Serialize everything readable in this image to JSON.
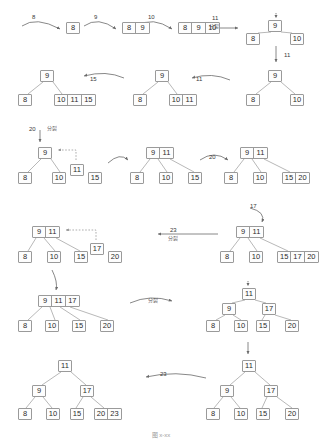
{
  "figure": {
    "caption": "图 x-xx",
    "colors": {
      "box_border": "#9a9a9a",
      "box_fill": "#fdfdfd",
      "text": "#2b2b2b",
      "arrow": "#6a6a6a",
      "dashed_arrow": "#8a8a8a"
    }
  },
  "labels": {
    "split": "分裂",
    "insert_8": "8",
    "insert_9": "9",
    "insert_10": "10",
    "insert_11": "11",
    "insert_15": "15",
    "insert_17": "17",
    "insert_20": "20",
    "insert_23": "23"
  },
  "chart_data": {
    "type": "diagram",
    "steps": [
      {
        "id": "s1",
        "row": 1,
        "keys_inserted": "8",
        "nodes": [
          {
            "keys": [
              "8"
            ],
            "level": 0
          }
        ]
      },
      {
        "id": "s2",
        "row": 1,
        "keys_inserted": "9",
        "nodes": [
          {
            "keys": [
              "8",
              "9"
            ],
            "level": 0
          }
        ]
      },
      {
        "id": "s3",
        "row": 1,
        "keys_inserted": "10",
        "nodes": [
          {
            "keys": [
              "8",
              "9",
              "10"
            ],
            "level": 0
          }
        ]
      },
      {
        "id": "s4",
        "row": 1,
        "keys_inserted": "11",
        "action": "分裂",
        "nodes": [
          {
            "keys": [
              "9"
            ],
            "level": 0
          },
          {
            "keys": [
              "8"
            ],
            "level": 1
          },
          {
            "keys": [
              "10"
            ],
            "level": 1
          }
        ]
      },
      {
        "id": "s5",
        "row": 2,
        "keys_inserted": "11",
        "nodes": [
          {
            "keys": [
              "9"
            ],
            "level": 0
          },
          {
            "keys": [
              "8"
            ],
            "level": 1
          },
          {
            "keys": [
              "10"
            ],
            "level": 1
          }
        ]
      },
      {
        "id": "s6",
        "row": 2,
        "keys_inserted": "11",
        "nodes": [
          {
            "keys": [
              "9"
            ],
            "level": 0
          },
          {
            "keys": [
              "8"
            ],
            "level": 1
          },
          {
            "keys": [
              "10",
              "11"
            ],
            "level": 1
          }
        ]
      },
      {
        "id": "s7",
        "row": 2,
        "keys_inserted": "15",
        "nodes": [
          {
            "keys": [
              "9"
            ],
            "level": 0
          },
          {
            "keys": [
              "8"
            ],
            "level": 1
          },
          {
            "keys": [
              "10",
              "11",
              "15"
            ],
            "level": 1
          }
        ]
      },
      {
        "id": "s8",
        "row": 3,
        "keys_inserted": "20",
        "action": "分裂",
        "nodes": [
          {
            "keys": [
              "9"
            ],
            "level": 0
          },
          {
            "keys": [
              "8"
            ],
            "level": 1
          },
          {
            "keys": [
              "10"
            ],
            "level": 1
          },
          {
            "keys": [
              "11"
            ],
            "level": 1,
            "promote": true
          },
          {
            "keys": [
              "15"
            ],
            "level": 1
          }
        ]
      },
      {
        "id": "s9",
        "row": 3,
        "nodes": [
          {
            "keys": [
              "9",
              "11"
            ],
            "level": 0
          },
          {
            "keys": [
              "8"
            ],
            "level": 1
          },
          {
            "keys": [
              "10"
            ],
            "level": 1
          },
          {
            "keys": [
              "15"
            ],
            "level": 1
          }
        ]
      },
      {
        "id": "s10",
        "row": 3,
        "keys_inserted": "20",
        "nodes": [
          {
            "keys": [
              "9",
              "11"
            ],
            "level": 0
          },
          {
            "keys": [
              "8"
            ],
            "level": 1
          },
          {
            "keys": [
              "10"
            ],
            "level": 1
          },
          {
            "keys": [
              "15",
              "20"
            ],
            "level": 1
          }
        ]
      },
      {
        "id": "s11",
        "row": 4,
        "keys_inserted": "17",
        "nodes": [
          {
            "keys": [
              "9",
              "11"
            ],
            "level": 0
          },
          {
            "keys": [
              "8"
            ],
            "level": 1
          },
          {
            "keys": [
              "10"
            ],
            "level": 1
          },
          {
            "keys": [
              "15",
              "17",
              "20"
            ],
            "level": 1
          }
        ]
      },
      {
        "id": "s12",
        "row": 4,
        "keys_inserted": "23",
        "action": "分裂",
        "nodes": [
          {
            "keys": [
              "9",
              "11"
            ],
            "level": 0
          },
          {
            "keys": [
              "8"
            ],
            "level": 1
          },
          {
            "keys": [
              "10"
            ],
            "level": 1
          },
          {
            "keys": [
              "15"
            ],
            "level": 1
          },
          {
            "keys": [
              "17"
            ],
            "level": 1,
            "promote": true
          },
          {
            "keys": [
              "20"
            ],
            "level": 1
          }
        ]
      },
      {
        "id": "s13",
        "row": 5,
        "nodes": [
          {
            "keys": [
              "9",
              "11",
              "17"
            ],
            "level": 0
          },
          {
            "keys": [
              "8"
            ],
            "level": 1
          },
          {
            "keys": [
              "10"
            ],
            "level": 1
          },
          {
            "keys": [
              "15"
            ],
            "level": 1
          },
          {
            "keys": [
              "20"
            ],
            "level": 1
          }
        ]
      },
      {
        "id": "s14",
        "row": 5,
        "action": "分裂",
        "nodes": [
          {
            "keys": [
              "11"
            ],
            "level": 0
          },
          {
            "keys": [
              "9"
            ],
            "level": 1
          },
          {
            "keys": [
              "17"
            ],
            "level": 1
          },
          {
            "keys": [
              "8"
            ],
            "level": 2
          },
          {
            "keys": [
              "10"
            ],
            "level": 2
          },
          {
            "keys": [
              "15"
            ],
            "level": 2
          },
          {
            "keys": [
              "20"
            ],
            "level": 2
          }
        ]
      },
      {
        "id": "s15",
        "row": 6,
        "nodes": [
          {
            "keys": [
              "11"
            ],
            "level": 0
          },
          {
            "keys": [
              "9"
            ],
            "level": 1
          },
          {
            "keys": [
              "17"
            ],
            "level": 1
          },
          {
            "keys": [
              "8"
            ],
            "level": 2
          },
          {
            "keys": [
              "10"
            ],
            "level": 2
          },
          {
            "keys": [
              "15"
            ],
            "level": 2
          },
          {
            "keys": [
              "20"
            ],
            "level": 2
          }
        ]
      },
      {
        "id": "s16",
        "row": 6,
        "keys_inserted": "23",
        "nodes": [
          {
            "keys": [
              "11"
            ],
            "level": 0
          },
          {
            "keys": [
              "9"
            ],
            "level": 1
          },
          {
            "keys": [
              "17"
            ],
            "level": 1
          },
          {
            "keys": [
              "8"
            ],
            "level": 2
          },
          {
            "keys": [
              "10"
            ],
            "level": 2
          },
          {
            "keys": [
              "15"
            ],
            "level": 2
          },
          {
            "keys": [
              "20",
              "23"
            ],
            "level": 2
          }
        ]
      }
    ],
    "boxes": [
      {
        "name": "r1-n1",
        "x": 66,
        "y": 22,
        "cells": [
          "8"
        ]
      },
      {
        "name": "r1-n2",
        "x": 122,
        "y": 22,
        "cells": [
          "8",
          "9"
        ]
      },
      {
        "name": "r1-n3",
        "x": 178,
        "y": 22,
        "cells": [
          "8",
          "9",
          "10"
        ]
      },
      {
        "name": "r1-root",
        "x": 268,
        "y": 20,
        "cells": [
          "9"
        ]
      },
      {
        "name": "r1-l1",
        "x": 246,
        "y": 33,
        "cells": [
          "8"
        ]
      },
      {
        "name": "r1-l2",
        "x": 290,
        "y": 33,
        "cells": [
          "10"
        ]
      },
      {
        "name": "r2-root-c",
        "x": 268,
        "y": 70,
        "cells": [
          "9"
        ]
      },
      {
        "name": "r2-l1-c",
        "x": 246,
        "y": 94,
        "cells": [
          "8"
        ]
      },
      {
        "name": "r2-l2-c",
        "x": 290,
        "y": 94,
        "cells": [
          "10"
        ]
      },
      {
        "name": "r2-root-b",
        "x": 155,
        "y": 70,
        "cells": [
          "9"
        ]
      },
      {
        "name": "r2-l1-b",
        "x": 133,
        "y": 94,
        "cells": [
          "8"
        ]
      },
      {
        "name": "r2-l2-b",
        "x": 169,
        "y": 94,
        "cells": [
          "10",
          "11"
        ]
      },
      {
        "name": "r2-root-a",
        "x": 40,
        "y": 70,
        "cells": [
          "9"
        ]
      },
      {
        "name": "r2-l1-a",
        "x": 18,
        "y": 94,
        "cells": [
          "8"
        ]
      },
      {
        "name": "r2-l2-a",
        "x": 54,
        "y": 94,
        "cells": [
          "10",
          "11",
          "15"
        ]
      },
      {
        "name": "r3-root-a",
        "x": 38,
        "y": 147,
        "cells": [
          "9"
        ]
      },
      {
        "name": "r3-l1-a",
        "x": 18,
        "y": 172,
        "cells": [
          "8"
        ]
      },
      {
        "name": "r3-l2-a",
        "x": 52,
        "y": 172,
        "cells": [
          "10"
        ]
      },
      {
        "name": "r3-mid-a",
        "x": 70,
        "y": 164,
        "cells": [
          "11"
        ]
      },
      {
        "name": "r3-l3-a",
        "x": 88,
        "y": 172,
        "cells": [
          "15"
        ]
      },
      {
        "name": "r3-root-b",
        "x": 146,
        "y": 147,
        "cells": [
          "9",
          "11"
        ]
      },
      {
        "name": "r3-l1-b",
        "x": 130,
        "y": 172,
        "cells": [
          "8"
        ]
      },
      {
        "name": "r3-l2-b",
        "x": 159,
        "y": 172,
        "cells": [
          "10"
        ]
      },
      {
        "name": "r3-l3-b",
        "x": 188,
        "y": 172,
        "cells": [
          "15"
        ]
      },
      {
        "name": "r3-root-c",
        "x": 240,
        "y": 147,
        "cells": [
          "9",
          "11"
        ]
      },
      {
        "name": "r3-l1-c",
        "x": 224,
        "y": 172,
        "cells": [
          "8"
        ]
      },
      {
        "name": "r3-l2-c",
        "x": 253,
        "y": 172,
        "cells": [
          "10"
        ]
      },
      {
        "name": "r3-l3-c",
        "x": 282,
        "y": 172,
        "cells": [
          "15",
          "20"
        ]
      },
      {
        "name": "r4-root-r",
        "x": 236,
        "y": 226,
        "cells": [
          "9",
          "11"
        ]
      },
      {
        "name": "r4-l1-r",
        "x": 220,
        "y": 251,
        "cells": [
          "8"
        ]
      },
      {
        "name": "r4-l2-r",
        "x": 249,
        "y": 251,
        "cells": [
          "10"
        ]
      },
      {
        "name": "r4-l3-r",
        "x": 277,
        "y": 251,
        "cells": [
          "15",
          "17",
          "20"
        ]
      },
      {
        "name": "r4-root-l",
        "x": 32,
        "y": 226,
        "cells": [
          "9",
          "11"
        ]
      },
      {
        "name": "r4-l1-l",
        "x": 18,
        "y": 251,
        "cells": [
          "8"
        ]
      },
      {
        "name": "r4-l2-l",
        "x": 47,
        "y": 251,
        "cells": [
          "10"
        ]
      },
      {
        "name": "r4-l3-l",
        "x": 74,
        "y": 251,
        "cells": [
          "15"
        ]
      },
      {
        "name": "r4-mid-l",
        "x": 90,
        "y": 243,
        "cells": [
          "17"
        ]
      },
      {
        "name": "r4-l4-l",
        "x": 108,
        "y": 251,
        "cells": [
          "20"
        ]
      },
      {
        "name": "r5-root-l",
        "x": 38,
        "y": 295,
        "cells": [
          "9",
          "11",
          "17"
        ]
      },
      {
        "name": "r5-l1-l",
        "x": 18,
        "y": 320,
        "cells": [
          "8"
        ]
      },
      {
        "name": "r5-l2-l",
        "x": 45,
        "y": 320,
        "cells": [
          "10"
        ]
      },
      {
        "name": "r5-l3-l",
        "x": 72,
        "y": 320,
        "cells": [
          "15"
        ]
      },
      {
        "name": "r5-l4-l",
        "x": 100,
        "y": 320,
        "cells": [
          "20"
        ]
      },
      {
        "name": "r5-root-r",
        "x": 242,
        "y": 288,
        "cells": [
          "11"
        ]
      },
      {
        "name": "r5-m1-r",
        "x": 222,
        "y": 303,
        "cells": [
          "9"
        ]
      },
      {
        "name": "r5-m2-r",
        "x": 262,
        "y": 303,
        "cells": [
          "17"
        ]
      },
      {
        "name": "r5-l1-r",
        "x": 206,
        "y": 320,
        "cells": [
          "8"
        ]
      },
      {
        "name": "r5-l2-r",
        "x": 234,
        "y": 320,
        "cells": [
          "10"
        ]
      },
      {
        "name": "r5-l3-r",
        "x": 256,
        "y": 320,
        "cells": [
          "15"
        ]
      },
      {
        "name": "r5-l4-r",
        "x": 285,
        "y": 320,
        "cells": [
          "20"
        ]
      },
      {
        "name": "r6-root-r",
        "x": 242,
        "y": 360,
        "cells": [
          "11"
        ]
      },
      {
        "name": "r6-m1-r",
        "x": 220,
        "y": 385,
        "cells": [
          "9"
        ]
      },
      {
        "name": "r6-m2-r",
        "x": 264,
        "y": 385,
        "cells": [
          "17"
        ]
      },
      {
        "name": "r6-l1-r",
        "x": 206,
        "y": 408,
        "cells": [
          "8"
        ]
      },
      {
        "name": "r6-l2-r",
        "x": 234,
        "y": 408,
        "cells": [
          "10"
        ]
      },
      {
        "name": "r6-l3-r",
        "x": 256,
        "y": 408,
        "cells": [
          "15"
        ]
      },
      {
        "name": "r6-l4-r",
        "x": 285,
        "y": 408,
        "cells": [
          "20"
        ]
      },
      {
        "name": "r6-root-l",
        "x": 58,
        "y": 360,
        "cells": [
          "11"
        ]
      },
      {
        "name": "r6-m1-l",
        "x": 32,
        "y": 385,
        "cells": [
          "9"
        ]
      },
      {
        "name": "r6-m2-l",
        "x": 80,
        "y": 385,
        "cells": [
          "17"
        ]
      },
      {
        "name": "r6-l1-l",
        "x": 18,
        "y": 408,
        "cells": [
          "8"
        ]
      },
      {
        "name": "r6-l2-l",
        "x": 46,
        "y": 408,
        "cells": [
          "10"
        ]
      },
      {
        "name": "r6-l3-l",
        "x": 70,
        "y": 408,
        "cells": [
          "15"
        ]
      },
      {
        "name": "r6-l4-l",
        "x": 94,
        "y": 408,
        "cells": [
          "20",
          "23"
        ]
      }
    ],
    "arrow_labels": [
      {
        "name": "lab-8",
        "text": "8",
        "x": 32,
        "y": 14
      },
      {
        "name": "lab-9",
        "text": "9",
        "x": 94,
        "y": 14
      },
      {
        "name": "lab-10",
        "text": "10",
        "x": 148,
        "y": 14
      },
      {
        "name": "lab-11a",
        "text": "11",
        "x": 212,
        "y": 15
      },
      {
        "name": "lab-11a-cn",
        "text": "分裂",
        "x": 209,
        "y": 24
      },
      {
        "name": "lab-11b",
        "text": "11",
        "x": 284,
        "y": 52
      },
      {
        "name": "lab-11c",
        "text": "11",
        "x": 196,
        "y": 76
      },
      {
        "name": "lab-15",
        "text": "15",
        "x": 90,
        "y": 76
      },
      {
        "name": "lab-20a",
        "text": "20",
        "x": 29,
        "y": 126
      },
      {
        "name": "lab-20a-cn",
        "text": "分裂",
        "x": 47,
        "y": 126
      },
      {
        "name": "lab-20b",
        "text": "20",
        "x": 209,
        "y": 154
      },
      {
        "name": "lab-17",
        "text": "17",
        "x": 250,
        "y": 203
      },
      {
        "name": "lab-23a",
        "text": "23",
        "x": 170,
        "y": 227
      },
      {
        "name": "lab-23a-cn",
        "text": "分裂",
        "x": 168,
        "y": 236
      },
      {
        "name": "lab-split-mid",
        "text": "分裂",
        "x": 148,
        "y": 298
      },
      {
        "name": "lab-23b",
        "text": "23",
        "x": 160,
        "y": 371
      }
    ]
  }
}
